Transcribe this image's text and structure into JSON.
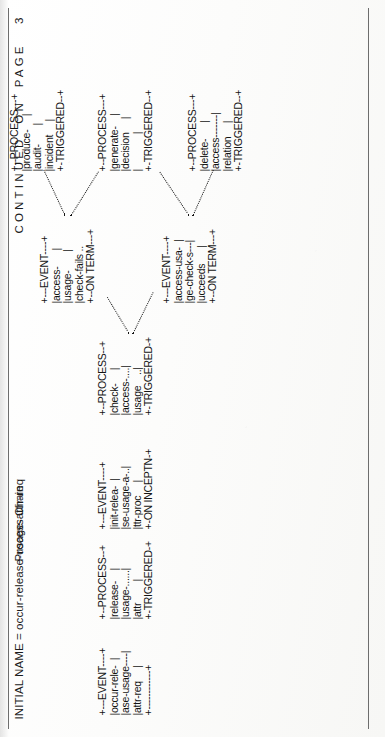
{
  "page": {
    "header_initial_name": "INITIAL NAME = occur-release-usage-attir-req",
    "diagram_title": "Process Chain",
    "footer_continued": "CONTINUED  ON  PAGE   3",
    "page_number": "3",
    "ink_color": "#141414",
    "rule_color": "#6d6d6d",
    "paper_color": "#fdfdfc"
  },
  "diagram": {
    "type": "ascii-art-flow",
    "nodes": [
      {
        "id": "event-occur-release",
        "kind": "EVENT",
        "top_rule": "+---EVENT----+",
        "body": [
          "|occur-rele-  |",
          "|ase-usage----|",
          "|attr-req     |"
        ],
        "bottom_rule": "+------------+",
        "art": "+---EVENT----+\n|occur-rele-  |\n|ase-usage----|\n|attr-req     |\n+------------+"
      },
      {
        "id": "process-release-usage-attr",
        "kind": "PROCESS",
        "top_rule": "+--PROCESS--+",
        "body": [
          "|release-    |",
          "|usage-......|",
          "|attr        |"
        ],
        "bottom_rule": "+-TRIGGERED-+",
        "art": "+--PROCESS--+\n|release-    |\n|usage-......|\n|attr        |\n+-TRIGGERED-+"
      },
      {
        "id": "event-init-release-usage-attr-proc",
        "kind": "EVENT",
        "top_rule": "+---EVENT----+",
        "body": [
          "|init-relea-  |",
          "|se-usage-a-..|",
          "|ttr-proc     |"
        ],
        "bottom_rule": "+-ON INCEPTN-+",
        "art": "+---EVENT----+\n|init-relea-  |\n|se-usage-a-..|\n|ttr-proc     |\n+-ON INCEPTN-+"
      },
      {
        "id": "process-check-access-usage",
        "kind": "PROCESS",
        "top_rule": "+--PROCESS--+",
        "body": [
          "|check-     |",
          "|access-....|",
          "|usage    ..|"
        ],
        "bottom_rule": "+-TRIGGERED-+",
        "art": "+--PROCESS--+\n|check-     |\n|access-....|\n|usage    ..|\n+-TRIGGERED-+"
      },
      {
        "id": "event-access-usage-check-fails",
        "kind": "EVENT",
        "top_rule": "+---EVENT----+",
        "body": [
          "|access-      |",
          "|usage-       |",
          "|check-fails .."
        ],
        "bottom_rule": "+--ON TERM---+",
        "art": "+---EVENT----+\n|access-      |\n|usage-       |\n|check-fails ..\n+--ON TERM---+"
      },
      {
        "id": "event-access-usage-check-succeeds",
        "kind": "EVENT",
        "top_rule": "+---EVENT----+",
        "body": [
          "|access-usa-  |",
          "|ge-check-s---|",
          "|ucceeds      |"
        ],
        "bottom_rule": "+--ON TERM---+",
        "art": "+---EVENT----+\n|access-usa-  |\n|ge-check-s---|\n|ucceeds      |\n+--ON TERM---+"
      },
      {
        "id": "process-produce-audit-incident",
        "kind": "PROCESS",
        "top_rule": "+--PROCESS---+",
        "body": [
          "|produce-     |",
          "|audit-       |",
          "|incident     |"
        ],
        "bottom_rule": "+-TRIGGERED--+",
        "art": "+--PROCESS---+\n|produce-     |\n|audit-       |\n|incident     |\n+-TRIGGERED--+"
      },
      {
        "id": "process-generate-decision",
        "kind": "PROCESS",
        "top_rule": "+--PROCESS---+",
        "body": [
          "|generate-    |",
          "|decision     |",
          "|             |"
        ],
        "bottom_rule": "+-TRIGGERED--+",
        "art": "+--PROCESS---+\n|generate-    |\n|decision     |\n|             |\n+-TRIGGERED--+"
      },
      {
        "id": "process-delete-access-relation",
        "kind": "PROCESS",
        "top_rule": "+--PROCESS---+",
        "body": [
          "|delete-      |",
          "|access-------|",
          "|relation     |"
        ],
        "bottom_rule": "+-TRIGGERED--+",
        "art": "+--PROCESS---+\n|delete-      |\n|access-------|\n|relation     |\n+-TRIGGERED--+"
      }
    ],
    "edges": [
      {
        "from": "event-occur-release",
        "to": "process-release-usage-attr"
      },
      {
        "from": "process-release-usage-attr",
        "to": "event-init-release-usage-attr-proc"
      },
      {
        "from": "event-init-release-usage-attr-proc",
        "to": "process-check-access-usage"
      },
      {
        "from": "process-check-access-usage",
        "to": "event-access-usage-check-fails"
      },
      {
        "from": "process-check-access-usage",
        "to": "event-access-usage-check-succeeds"
      },
      {
        "from": "event-access-usage-check-fails",
        "to": "process-produce-audit-incident"
      },
      {
        "from": "event-access-usage-check-fails",
        "to": "process-generate-decision"
      },
      {
        "from": "event-access-usage-check-succeeds",
        "to": "process-generate-decision"
      },
      {
        "from": "event-access-usage-check-succeeds",
        "to": "process-delete-access-relation"
      }
    ]
  }
}
